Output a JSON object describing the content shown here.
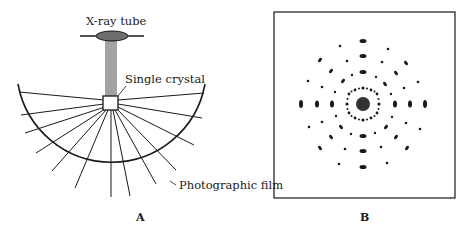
{
  "figure": {
    "panel_a": {
      "label": "A",
      "annotations": {
        "tube": "X-ray tube",
        "crystal": "Single crystal",
        "film": "Photographic film"
      }
    },
    "panel_b": {
      "label": "B",
      "description": "Laue diffraction spot pattern"
    }
  },
  "colors": {
    "ink": "#1a1a1a",
    "background": "#ffffff",
    "tube_fill": "#6e6e6e"
  }
}
